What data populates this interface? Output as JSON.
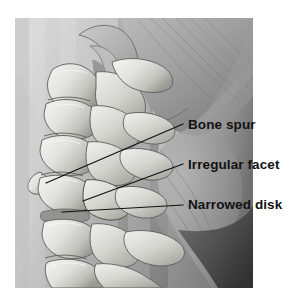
{
  "figure": {
    "name": "cervical-spine-lateral-illustration",
    "background_color": "#ffffff",
    "photo_region": {
      "x": 15,
      "y": 18,
      "width": 238,
      "height": 270
    },
    "palette": {
      "skin_light": "#d2d2d2",
      "skin_mid": "#a8a8a8",
      "skin_dark": "#7d7d7d",
      "shadow_deep": "#3a3a3a",
      "bone_highlight": "#f2f2f0",
      "bone_mid": "#cfcfcb",
      "bone_shadow": "#8e8e8a",
      "outline": "#4a4a4a",
      "label_text": "#121212",
      "leader_line": "#101010"
    }
  },
  "annotations": [
    {
      "id": "bone-spur",
      "label": "Bone spur",
      "text_x": 188,
      "text_y": 129,
      "leader": {
        "x1": 183,
        "y1": 124,
        "x2": 46,
        "y2": 183
      }
    },
    {
      "id": "irregular-facet",
      "label": "Irregular facet",
      "text_x": 188,
      "text_y": 169,
      "leader": {
        "x1": 183,
        "y1": 164,
        "x2": 83,
        "y2": 201
      }
    },
    {
      "id": "narrowed-disk",
      "label": "Narrowed disk",
      "text_x": 188,
      "text_y": 209,
      "leader": {
        "x1": 183,
        "y1": 205,
        "x2": 62,
        "y2": 212
      }
    }
  ]
}
